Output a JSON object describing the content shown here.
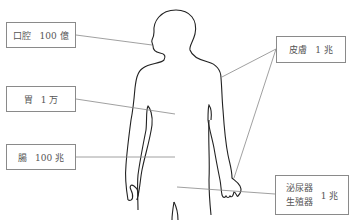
{
  "diagram": {
    "title": "",
    "labels": [
      {
        "id": "mouth",
        "organ": "口腔",
        "count": "100 億"
      },
      {
        "id": "skin",
        "organ": "皮膚",
        "count": "1 兆"
      },
      {
        "id": "stomach",
        "organ": "胃",
        "count": "1 万"
      },
      {
        "id": "intestine",
        "organ": "腸",
        "count": "100 兆"
      },
      {
        "id": "urogenital",
        "organ_line1": "泌尿器",
        "organ_line2": "生殖器",
        "count": "1 兆"
      }
    ],
    "colors": {
      "outline": "#222222",
      "leader_line": "#888888",
      "box_border": "#8a8a8a",
      "text": "#555555"
    }
  }
}
